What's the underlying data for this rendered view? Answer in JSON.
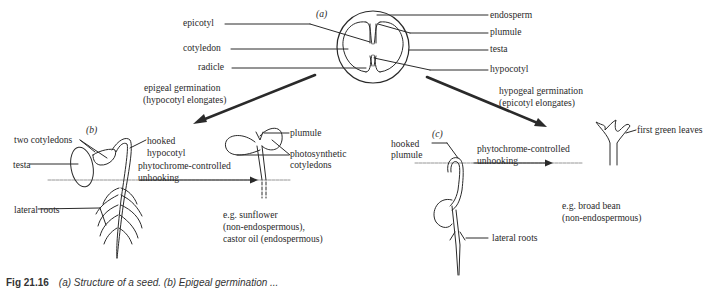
{
  "figure": {
    "caption_number": "Fig 21.16",
    "caption_text": "(a) Structure of a seed. (b) Epigeal germination ..."
  },
  "panel_a": {
    "tag": "(a)",
    "labels_left": [
      "epicotyl",
      "cotyledon",
      "radicle"
    ],
    "labels_right": [
      "endosperm",
      "plumule",
      "testa",
      "hypocotyl"
    ]
  },
  "arrows": {
    "epigeal": {
      "line1": "epigeal germination",
      "line2": "(hypocotyl elongates)"
    },
    "hypogeal": {
      "line1": "hypogeal germination",
      "line2": "(epicotyl elongates)"
    }
  },
  "panel_b": {
    "tag": "(b)",
    "two_cotyledons": "two cotyledons",
    "testa": "testa",
    "hooked_hypocotyl_1": "hooked",
    "hooked_hypocotyl_2": "hypocotyl",
    "phyto_1": "phytochrome-controlled",
    "phyto_2": "unhooking",
    "lateral_roots": "lateral roots",
    "plumule": "plumule",
    "photo_cot_1": "photosynthetic",
    "photo_cot_2": "cotyledons",
    "example_1": "e.g. sunflower",
    "example_2": "(non-endospermous),",
    "example_3": "castor oil (endospermous)"
  },
  "panel_c": {
    "tag": "(c)",
    "hooked_plumule_1": "hooked",
    "hooked_plumule_2": "plumule",
    "phyto_1": "phytochrome-controlled",
    "phyto_2": "unhooking",
    "first_green_leaves": "first green leaves",
    "lateral_roots": "lateral roots",
    "example_1": "e.g. broad bean",
    "example_2": "(non-endospermous)"
  },
  "colors": {
    "ink": "#2a2a2a",
    "soil": "#8a8a8a",
    "background": "#ffffff"
  }
}
